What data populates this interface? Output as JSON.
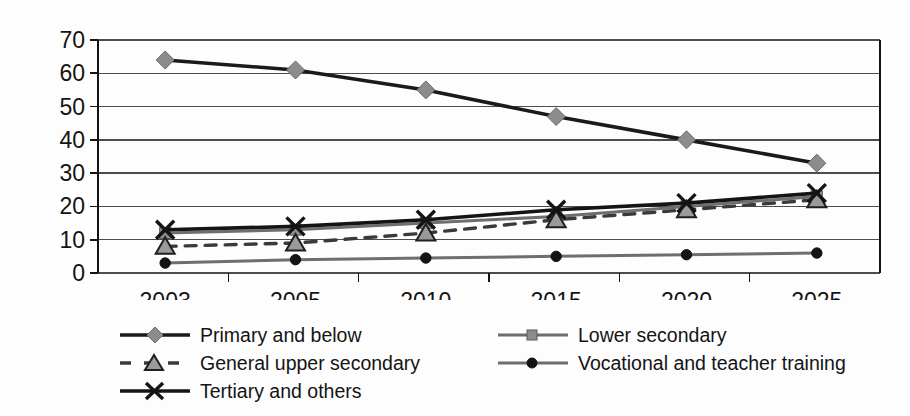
{
  "chart_data": {
    "type": "line",
    "title": "",
    "subtitle": "",
    "xlabel": "",
    "ylabel": "",
    "categories": [
      "2003",
      "2005",
      "2010",
      "2015",
      "2020",
      "2025"
    ],
    "x_tick_labels": [
      "2003",
      "2005",
      "2010",
      "2015",
      "2020",
      "2025"
    ],
    "y_tick_labels": [
      "0",
      "10",
      "20",
      "30",
      "40",
      "50",
      "60",
      "70"
    ],
    "y_ticks": [
      0,
      10,
      20,
      30,
      40,
      50,
      60,
      70
    ],
    "ylim": [
      0,
      70
    ],
    "grid": "horizontal",
    "legend_position": "bottom",
    "series": [
      {
        "name": "Primary and below",
        "marker": "diamond",
        "line_style": "solid",
        "line_color": "#1a1a1a",
        "marker_color": "#8c8c8c",
        "values": [
          64,
          61,
          55,
          47,
          40,
          33
        ]
      },
      {
        "name": "Lower secondary",
        "marker": "square",
        "line_style": "solid",
        "line_color": "#6e6e6e",
        "marker_color": "#8c8c8c",
        "values": [
          12,
          13,
          15,
          17,
          20,
          23
        ]
      },
      {
        "name": "General upper secondary",
        "marker": "triangle",
        "line_style": "dashed",
        "line_color": "#3a3a3a",
        "marker_color": "#9a9a9a",
        "values": [
          8,
          9,
          12,
          16,
          19,
          22
        ]
      },
      {
        "name": "Vocational and teacher training",
        "marker": "circle",
        "line_style": "solid",
        "line_color": "#6e6e6e",
        "marker_color": "#141414",
        "values": [
          3,
          4,
          4.5,
          5,
          5.5,
          6
        ]
      },
      {
        "name": "Tertiary and others",
        "marker": "cross",
        "line_style": "solid",
        "line_color": "#141414",
        "marker_color": "#141414",
        "values": [
          13,
          14,
          16,
          19,
          21,
          24
        ]
      }
    ]
  },
  "legend": {
    "columns": [
      {
        "items": [
          {
            "label": "Primary and below",
            "key": "line-diamond-key"
          },
          {
            "label": "General upper secondary",
            "key": "dashed-triangle-key"
          },
          {
            "label": "Tertiary and others",
            "key": "line-cross-key"
          }
        ]
      },
      {
        "items": [
          {
            "label": "Lower secondary",
            "key": "line-square-key"
          },
          {
            "label": "Vocational and teacher training",
            "key": "line-circle-key"
          }
        ]
      }
    ]
  },
  "colors": {
    "axis": "#141414",
    "grid": "#4d4d4d",
    "background": "#fdfdfd",
    "text": "#141414"
  }
}
